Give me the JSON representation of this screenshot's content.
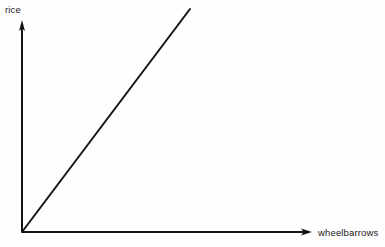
{
  "figure": {
    "background_color": "#fefefe",
    "ink_color": "#141414"
  },
  "chart_data": {
    "type": "line",
    "title": "",
    "subtitle": "",
    "xlabel": "wheelbarrows",
    "ylabel": "rice",
    "grid": false,
    "legend": null,
    "axis_style": "arrow-headed open axes, no tick marks, no tick labels",
    "xlim": [
      0,
      1
    ],
    "ylim": [
      0,
      1
    ],
    "xticks": [],
    "yticks": [],
    "annotations": [],
    "series": [
      {
        "name": "rice vs wheelbarrows",
        "type": "line",
        "comment": "straight ray rising from the origin",
        "x": [
          0,
          1
        ],
        "y": [
          0,
          1
        ],
        "color": "#141414",
        "linewidth": 2
      }
    ]
  },
  "labels": {
    "y_axis": "rice",
    "x_axis": "wheelbarrows"
  },
  "geometry": {
    "origin_x": 22,
    "origin_y": 232,
    "y_axis_top": 20,
    "x_axis_right": 312,
    "line_end_x": 190,
    "line_end_y": 9
  }
}
